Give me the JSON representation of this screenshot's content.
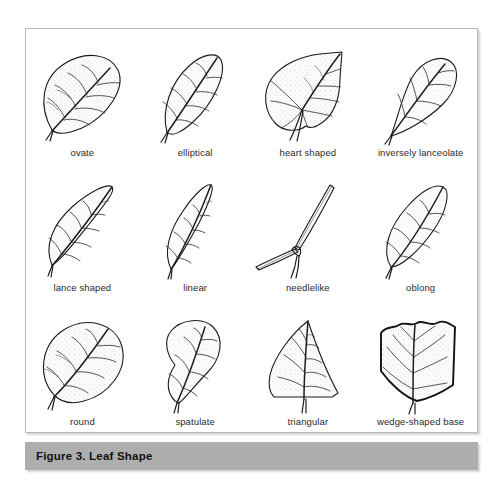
{
  "figure": {
    "caption": "Figure 3. Leaf Shape",
    "border_color": "#b9b9b9",
    "caption_bar_color": "#aeaeae",
    "caption_text_color": "#111111",
    "background": "#ffffff",
    "ink_color": "#1a1a1a"
  },
  "grid": {
    "columns": 4,
    "rows": 3
  },
  "leaves": [
    {
      "id": "ovate",
      "label": "ovate",
      "row": 1,
      "column": 1
    },
    {
      "id": "elliptical",
      "label": "elliptical",
      "row": 1,
      "column": 2
    },
    {
      "id": "heart-shaped",
      "label": "heart shaped",
      "row": 1,
      "column": 3
    },
    {
      "id": "inversely-lanceolate",
      "label": "inversely lanceolate",
      "row": 1,
      "column": 4
    },
    {
      "id": "lance-shaped",
      "label": "lance shaped",
      "row": 2,
      "column": 1
    },
    {
      "id": "linear",
      "label": "linear",
      "row": 2,
      "column": 2
    },
    {
      "id": "needlelike",
      "label": "needlelike",
      "row": 2,
      "column": 3
    },
    {
      "id": "oblong",
      "label": "oblong",
      "row": 2,
      "column": 4
    },
    {
      "id": "round",
      "label": "round",
      "row": 3,
      "column": 1
    },
    {
      "id": "spatulate",
      "label": "spatulate",
      "row": 3,
      "column": 2
    },
    {
      "id": "triangular",
      "label": "triangular",
      "row": 3,
      "column": 3
    },
    {
      "id": "wedge-shaped-base",
      "label": "wedge-shaped base",
      "row": 3,
      "column": 4
    }
  ]
}
